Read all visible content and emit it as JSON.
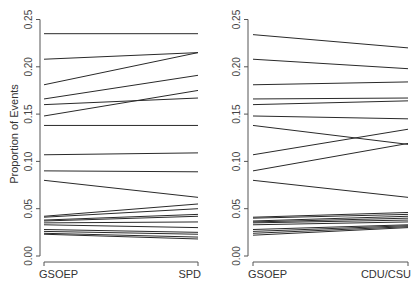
{
  "chart_data": [
    {
      "type": "line",
      "subtype": "slope",
      "title": "",
      "xlabel": "",
      "ylabel": "Proportion of Events",
      "categories": [
        "GSOEP",
        "SPD"
      ],
      "ylim": [
        0,
        0.25
      ],
      "yticks": [
        "0.00",
        "0.05",
        "0.10",
        "0.15",
        "0.20",
        "0.25"
      ],
      "grid": false,
      "series": [
        {
          "name": "s1",
          "values": [
            0.235,
            0.235
          ]
        },
        {
          "name": "s2",
          "values": [
            0.208,
            0.215
          ]
        },
        {
          "name": "s3",
          "values": [
            0.181,
            0.215
          ]
        },
        {
          "name": "s4",
          "values": [
            0.166,
            0.191
          ]
        },
        {
          "name": "s5",
          "values": [
            0.16,
            0.167
          ]
        },
        {
          "name": "s6",
          "values": [
            0.148,
            0.175
          ]
        },
        {
          "name": "s7",
          "values": [
            0.138,
            0.138
          ]
        },
        {
          "name": "s8",
          "values": [
            0.107,
            0.109
          ]
        },
        {
          "name": "s9",
          "values": [
            0.09,
            0.089
          ]
        },
        {
          "name": "s10",
          "values": [
            0.08,
            0.062
          ]
        },
        {
          "name": "s11",
          "values": [
            0.042,
            0.055
          ]
        },
        {
          "name": "s12",
          "values": [
            0.041,
            0.05
          ]
        },
        {
          "name": "s13",
          "values": [
            0.038,
            0.044
          ]
        },
        {
          "name": "s14",
          "values": [
            0.037,
            0.042
          ]
        },
        {
          "name": "s15",
          "values": [
            0.035,
            0.036
          ]
        },
        {
          "name": "s16",
          "values": [
            0.033,
            0.03
          ]
        },
        {
          "name": "s17",
          "values": [
            0.028,
            0.025
          ]
        },
        {
          "name": "s18",
          "values": [
            0.026,
            0.023
          ]
        },
        {
          "name": "s19",
          "values": [
            0.024,
            0.02
          ]
        },
        {
          "name": "s20",
          "values": [
            0.023,
            0.018
          ]
        }
      ]
    },
    {
      "type": "line",
      "subtype": "slope",
      "title": "",
      "xlabel": "",
      "ylabel": "",
      "categories": [
        "GSOEP",
        "CDU/CSU"
      ],
      "ylim": [
        0,
        0.25
      ],
      "yticks": [
        "0.00",
        "0.05",
        "0.10",
        "0.15",
        "0.20",
        "0.25"
      ],
      "grid": false,
      "series": [
        {
          "name": "s1",
          "values": [
            0.234,
            0.22
          ]
        },
        {
          "name": "s2",
          "values": [
            0.208,
            0.198
          ]
        },
        {
          "name": "s3",
          "values": [
            0.181,
            0.184
          ]
        },
        {
          "name": "s4",
          "values": [
            0.166,
            0.167
          ]
        },
        {
          "name": "s5",
          "values": [
            0.16,
            0.164
          ]
        },
        {
          "name": "s6",
          "values": [
            0.148,
            0.145
          ]
        },
        {
          "name": "s7",
          "values": [
            0.138,
            0.118
          ]
        },
        {
          "name": "s8",
          "values": [
            0.107,
            0.134
          ]
        },
        {
          "name": "s9",
          "values": [
            0.09,
            0.119
          ]
        },
        {
          "name": "s10",
          "values": [
            0.08,
            0.062
          ]
        },
        {
          "name": "s11",
          "values": [
            0.041,
            0.046
          ]
        },
        {
          "name": "s12",
          "values": [
            0.04,
            0.044
          ]
        },
        {
          "name": "s13",
          "values": [
            0.037,
            0.042
          ]
        },
        {
          "name": "s14",
          "values": [
            0.036,
            0.04
          ]
        },
        {
          "name": "s15",
          "values": [
            0.035,
            0.038
          ]
        },
        {
          "name": "s16",
          "values": [
            0.033,
            0.036
          ]
        },
        {
          "name": "s17",
          "values": [
            0.028,
            0.033
          ]
        },
        {
          "name": "s18",
          "values": [
            0.026,
            0.032
          ]
        },
        {
          "name": "s19",
          "values": [
            0.024,
            0.031
          ]
        },
        {
          "name": "s20",
          "values": [
            0.022,
            0.03
          ]
        }
      ]
    }
  ],
  "panels": [
    {
      "axis_x": 40,
      "cat_x": [
        44,
        198
      ]
    },
    {
      "axis_x": 248,
      "cat_x": [
        253,
        408
      ]
    }
  ],
  "ylabel": "Proportion of Events"
}
